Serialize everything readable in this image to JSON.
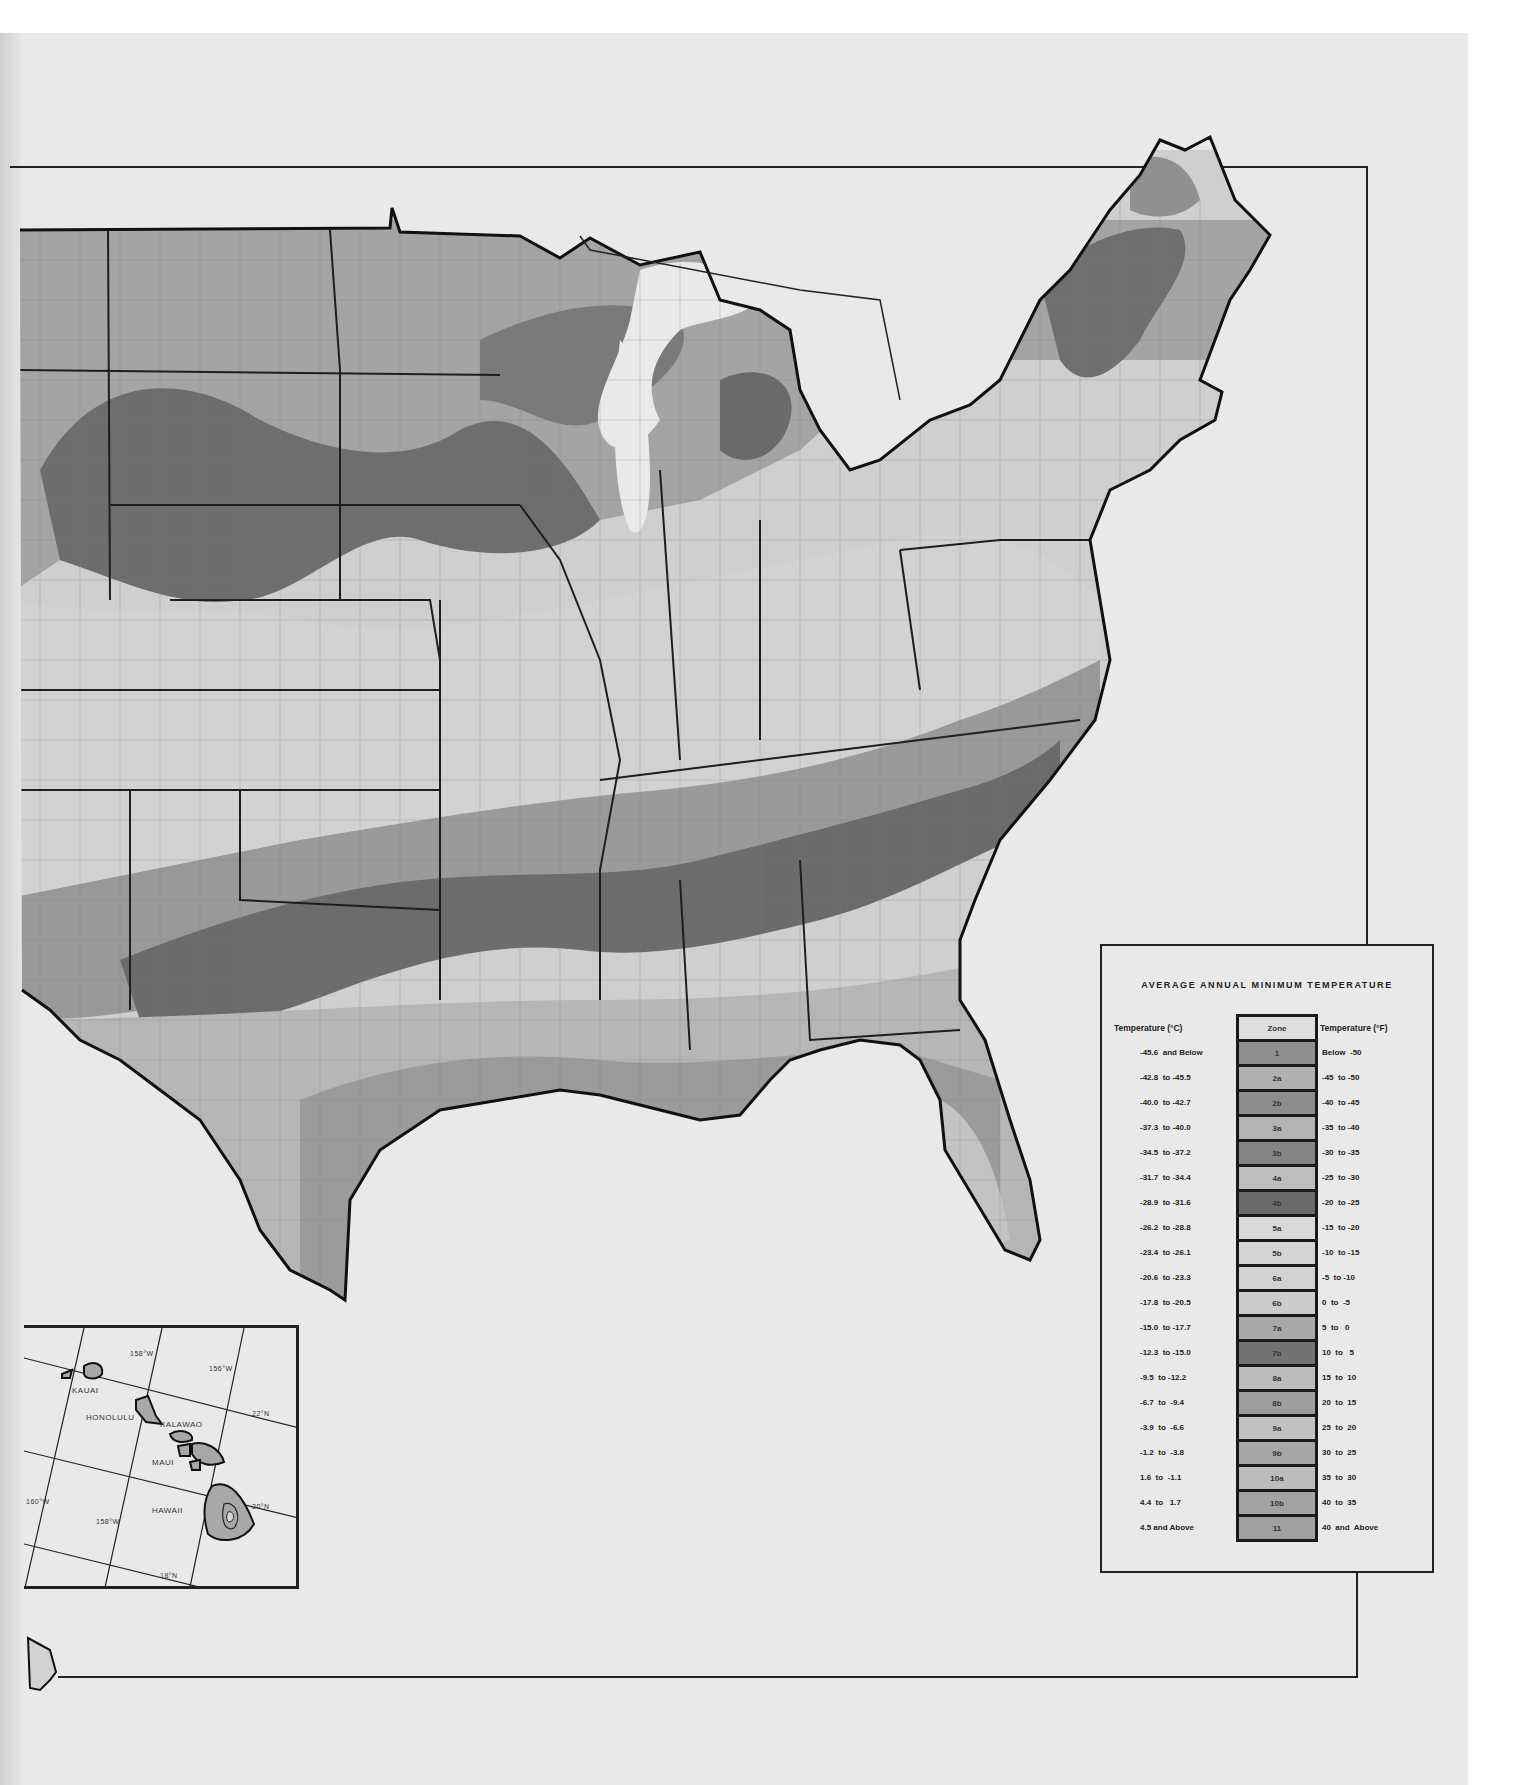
{
  "map": {
    "type": "USDA Plant Hardiness Zone Map (scanned page, contiguous US + Hawaii inset)",
    "page_background": "#e9e9e9",
    "zone_tones": {
      "1": "#8f8f8f",
      "2a": "#b0b0b0",
      "2b": "#8c8c8c",
      "3a": "#b3b3b3",
      "3b": "#858585",
      "4a": "#bdbdbd",
      "4b": "#6a6a6a",
      "5a": "#d9d9d9",
      "5b": "#d4d4d4",
      "6a": "#d2d2d2",
      "6b": "#cccccc",
      "7a": "#a8a8a8",
      "7b": "#737373",
      "8a": "#bcbcbc",
      "8b": "#9e9e9e",
      "9a": "#c2c2c2",
      "9b": "#a6a6a6",
      "10a": "#bcbcbc",
      "10b": "#a3a3a3",
      "11": "#a0a0a0"
    }
  },
  "legend": {
    "title": "AVERAGE ANNUAL MINIMUM TEMPERATURE",
    "header_celsius": "Temperature (°C)",
    "header_zone": "Zone",
    "header_fahrenheit": "Temperature (°F)",
    "rows": [
      {
        "c": "-45.6  and Below",
        "zone": "1",
        "f": "Below  -50"
      },
      {
        "c": "-42.8  to -45.5",
        "zone": "2a",
        "f": "-45  to -50"
      },
      {
        "c": "-40.0  to -42.7",
        "zone": "2b",
        "f": "-40  to -45"
      },
      {
        "c": "-37.3  to -40.0",
        "zone": "3a",
        "f": "-35  to -40"
      },
      {
        "c": "-34.5  to -37.2",
        "zone": "3b",
        "f": "-30  to -35"
      },
      {
        "c": "-31.7  to -34.4",
        "zone": "4a",
        "f": "-25  to -30"
      },
      {
        "c": "-28.9  to -31.6",
        "zone": "4b",
        "f": "-20  to -25"
      },
      {
        "c": "-26.2  to -28.8",
        "zone": "5a",
        "f": "-15  to -20"
      },
      {
        "c": "-23.4  to -26.1",
        "zone": "5b",
        "f": "-10  to -15"
      },
      {
        "c": "-20.6  to -23.3",
        "zone": "6a",
        "f": "-5  to -10"
      },
      {
        "c": "-17.8  to -20.5",
        "zone": "6b",
        "f": "0  to  -5"
      },
      {
        "c": "-15.0  to -17.7",
        "zone": "7a",
        "f": "5  to   0"
      },
      {
        "c": "-12.3  to -15.0",
        "zone": "7b",
        "f": "10  to   5"
      },
      {
        "c": "-9.5  to -12.2",
        "zone": "8a",
        "f": "15  to  10"
      },
      {
        "c": "-6.7  to  -9.4",
        "zone": "8b",
        "f": "20  to  15"
      },
      {
        "c": "-3.9  to  -6.6",
        "zone": "9a",
        "f": "25  to  20"
      },
      {
        "c": "-1.2  to  -3.8",
        "zone": "9b",
        "f": "30  to  25"
      },
      {
        "c": "1.6  to  -1.1",
        "zone": "10a",
        "f": "35  to  30"
      },
      {
        "c": "4.4  to   1.7",
        "zone": "10b",
        "f": "40  to  35"
      },
      {
        "c": "4.5 and Above",
        "zone": "11",
        "f": "40  and  Above"
      }
    ]
  },
  "hawaii_inset": {
    "labels": {
      "kauai": "KAUAI",
      "honolulu": "HONOLULU",
      "kalawao": "KALAWAO",
      "maui": "MAUI",
      "hawaii": "HAWAII"
    },
    "graticule": {
      "lon_158_top": "158°W",
      "lon_156": "156°W",
      "lat_22": "22°N",
      "lat_20": "20°N",
      "lon_160": "160°W",
      "lon_158_bottom": "158°W",
      "lat_18": "18°N"
    }
  }
}
